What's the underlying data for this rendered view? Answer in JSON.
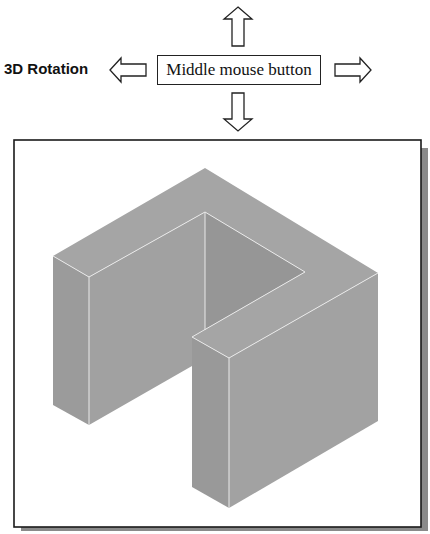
{
  "figure": {
    "label": "3D Rotation",
    "button_label": "Middle mouse button",
    "arrows": [
      "up",
      "down",
      "left",
      "right"
    ],
    "viewport": {
      "content": "isometric view of U-shaped solid block",
      "colors": {
        "frame_border": "#1a1a1a",
        "frame_shadow": "#8a8a8a",
        "top_face": "#a3a3a3",
        "left_face": "#9a9a9a",
        "right_face": "#a0a0a0",
        "inner_face": "#949494",
        "edge_highlight": "#e6e6e6"
      }
    }
  }
}
